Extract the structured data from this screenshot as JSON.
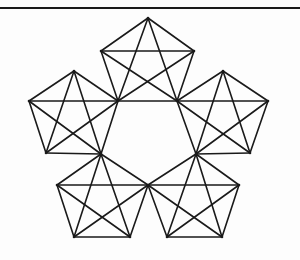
{
  "diagram": {
    "stroke_color": "#1a1a1a",
    "background": "#fdfdfd",
    "points": {
      "T": [
        148,
        18
      ],
      "L": [
        29,
        101
      ],
      "R": [
        268,
        101
      ],
      "BR": [
        222,
        237
      ],
      "BL": [
        74,
        237
      ],
      "A1": [
        101,
        51
      ],
      "B1": [
        194,
        51
      ],
      "A2": [
        74,
        71
      ],
      "B2": [
        223,
        71
      ],
      "C1": [
        46,
        153
      ],
      "D1": [
        250,
        153
      ],
      "C2": [
        57,
        185
      ],
      "D2": [
        239,
        185
      ],
      "E1": [
        130,
        237
      ],
      "E2": [
        167,
        237
      ],
      "I1": [
        118,
        101
      ],
      "I2": [
        177,
        101
      ],
      "I3": [
        196,
        154
      ],
      "I4": [
        148,
        185
      ],
      "I5": [
        101,
        154
      ]
    },
    "cells": [
      [
        "T",
        "B1",
        "I2",
        "I1",
        "A1"
      ],
      [
        "L",
        "A2",
        "I1",
        "I5",
        "C1"
      ],
      [
        "R",
        "D1",
        "I3",
        "I2",
        "B2"
      ],
      [
        "BL",
        "C2",
        "I5",
        "I4",
        "E1"
      ],
      [
        "BR",
        "E2",
        "I4",
        "I3",
        "D2"
      ]
    ]
  }
}
